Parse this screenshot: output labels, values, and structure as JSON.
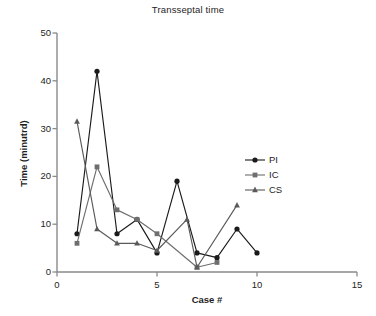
{
  "chart_data": {
    "type": "line",
    "title": "Transseptal time",
    "xlabel": "Case #",
    "ylabel": "Time (minutrd)",
    "xlim": [
      0,
      15
    ],
    "ylim": [
      0,
      50
    ],
    "xticks": [
      0,
      5,
      10,
      15
    ],
    "yticks": [
      0,
      10,
      20,
      30,
      40,
      50
    ],
    "grid": false,
    "legend_position": "right-middle",
    "series": [
      {
        "name": "PI",
        "marker": "circle",
        "color": "#1a1a1a",
        "points": [
          {
            "x": 1,
            "y": 8
          },
          {
            "x": 2,
            "y": 42
          },
          {
            "x": 3,
            "y": 8
          },
          {
            "x": 4,
            "y": 11
          },
          {
            "x": 5,
            "y": 4
          },
          {
            "x": 6,
            "y": 19
          },
          {
            "x": 7,
            "y": 4
          },
          {
            "x": 8,
            "y": 3
          },
          {
            "x": 9,
            "y": 9
          },
          {
            "x": 10,
            "y": 4
          }
        ]
      },
      {
        "name": "IC",
        "marker": "square",
        "color": "#6e6e6e",
        "points": [
          {
            "x": 1,
            "y": 6
          },
          {
            "x": 2,
            "y": 22
          },
          {
            "x": 3,
            "y": 13
          },
          {
            "x": 4,
            "y": 11
          },
          {
            "x": 5,
            "y": 8
          },
          {
            "x": 7,
            "y": 1
          },
          {
            "x": 8,
            "y": 2
          }
        ]
      },
      {
        "name": "CS",
        "marker": "triangle",
        "color": "#5a5a5a",
        "points": [
          {
            "x": 1,
            "y": 31.5
          },
          {
            "x": 2,
            "y": 9
          },
          {
            "x": 3,
            "y": 6
          },
          {
            "x": 4,
            "y": 6
          },
          {
            "x": 5,
            "y": 4.5
          },
          {
            "x": 6.5,
            "y": 11
          },
          {
            "x": 7,
            "y": 1
          },
          {
            "x": 9,
            "y": 14
          }
        ]
      }
    ]
  },
  "legend": {
    "entries": [
      {
        "label": "PI"
      },
      {
        "label": "IC"
      },
      {
        "label": "CS"
      }
    ]
  },
  "axis": {
    "y_tick_labels": [
      "0",
      "10",
      "20",
      "30",
      "40",
      "50"
    ],
    "x_tick_labels": [
      "0",
      "5",
      "10",
      "15"
    ]
  }
}
